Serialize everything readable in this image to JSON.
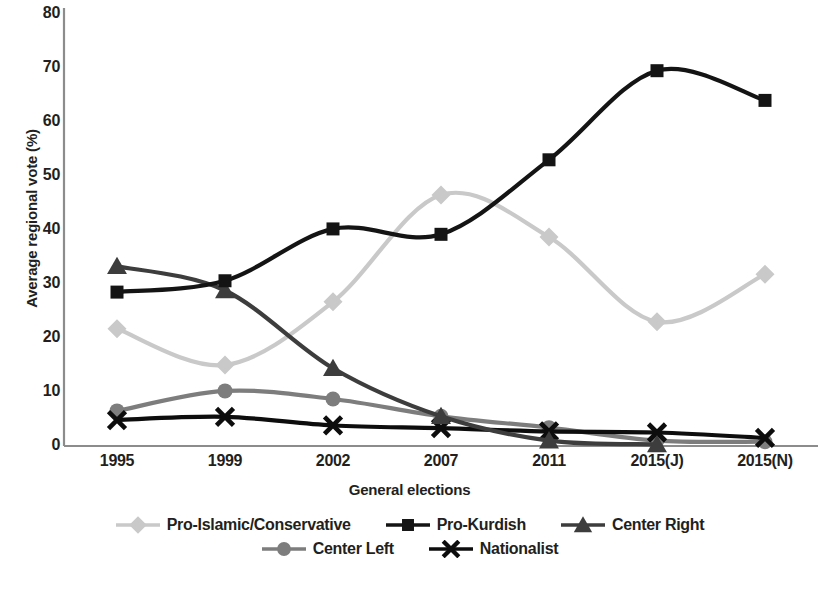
{
  "chart_data": {
    "type": "line",
    "title": "",
    "xlabel": "General elections",
    "ylabel": "Average regional vote (%)",
    "categories": [
      "1995",
      "1999",
      "2002",
      "2007",
      "2011",
      "2015(J)",
      "2015(N)"
    ],
    "ylim": [
      0,
      80
    ],
    "y_ticks": [
      "0",
      "10",
      "20",
      "30",
      "40",
      "50",
      "60",
      "70",
      "80"
    ],
    "grid": false,
    "legend_position": "bottom",
    "series": [
      {
        "name": "Pro-Islamic/Conservative",
        "color": "#c9c9c9",
        "marker": "diamond",
        "values": [
          21.7,
          15.0,
          26.7,
          46.5,
          38.7,
          23.0,
          31.8
        ]
      },
      {
        "name": "Pro-Kurdish",
        "color": "#141414",
        "marker": "square",
        "values": [
          28.5,
          30.6,
          40.2,
          39.2,
          53.0,
          69.5,
          64.0
        ]
      },
      {
        "name": "Center Right",
        "color": "#3d3d3d",
        "marker": "triangle",
        "values": [
          33.3,
          28.8,
          14.4,
          5.5,
          1.0,
          0.3,
          null
        ]
      },
      {
        "name": "Center Left",
        "color": "#7d7d7d",
        "marker": "circle",
        "values": [
          6.5,
          10.2,
          8.7,
          5.5,
          3.4,
          1.0,
          0.8
        ]
      },
      {
        "name": "Nationalist",
        "color": "#0d0d0d",
        "marker": "x",
        "values": [
          4.8,
          5.4,
          3.8,
          3.3,
          2.7,
          2.5,
          1.5
        ]
      }
    ]
  },
  "axes": {
    "y_title": "Average regional vote (%)",
    "x_title": "General elections"
  }
}
